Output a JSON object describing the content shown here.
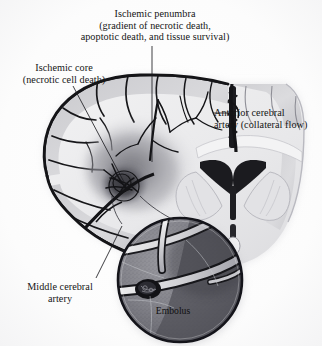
{
  "figure": {
    "kind": "medical-illustration",
    "background_color": "#fdfdfd",
    "ink_color": "#151515"
  },
  "labels": {
    "penumbra": {
      "name": "ischemic-penumbra-label",
      "line1": "Ischemic penumbra",
      "line2": "(gradient of necrotic death,",
      "line3": "apoptotic death, and tissue survival)",
      "text": "Ischemic penumbra\n(gradient of necrotic death,\napoptotic death, and tissue survival)"
    },
    "core": {
      "name": "ischemic-core-label",
      "line1": "Ischemic core",
      "line2": "(necrotic cell death)",
      "text": "Ischemic core\n(necrotic cell death)"
    },
    "anterior_cerebral_artery": {
      "name": "anterior-cerebral-artery-label",
      "line1": "Anterior cerebral",
      "line2": "artery (collateral flow)",
      "text": "Anterior cerebral\nartery (collateral flow)"
    },
    "middle_cerebral_artery": {
      "name": "middle-cerebral-artery-label",
      "line1": "Middle cerebral",
      "line2": "artery",
      "text": "Middle cerebral\nartery"
    },
    "embolus": {
      "name": "embolus-label",
      "text": "Embolus"
    }
  },
  "regions": [
    {
      "id": "ischemic-core",
      "label": "Ischemic core",
      "tone": "dark-gray",
      "color": "#5d5d62"
    },
    {
      "id": "ischemic-penumbra",
      "label": "Ischemic penumbra",
      "tone": "mid-gray gradient",
      "color": "#9a9aa0"
    },
    {
      "id": "cortex-gray-matter",
      "label": "Cerebral cortex",
      "tone": "light-gray",
      "color": "#cfcfd2"
    },
    {
      "id": "white-matter",
      "label": "White matter",
      "tone": "near-white",
      "color": "#ececee"
    },
    {
      "id": "lateral-ventricles",
      "label": "Lateral ventricles",
      "tone": "black",
      "color": "#1c1c1e"
    },
    {
      "id": "third-ventricle",
      "label": "Third ventricle",
      "tone": "black",
      "color": "#1c1c1e"
    },
    {
      "id": "magnifier-inset",
      "label": "Embolus magnification",
      "tone": "stippled gray",
      "color": "#7b7b80"
    }
  ],
  "leaders": [
    {
      "id": "leader-penumbra",
      "from_label": "penumbra",
      "to_region": "ischemic-penumbra"
    },
    {
      "id": "leader-core",
      "from_label": "core",
      "to_region": "ischemic-core"
    },
    {
      "id": "leader-aca",
      "from_label": "anterior_cerebral_artery",
      "to_region": "anterior-cerebral-artery-vessel"
    },
    {
      "id": "leader-mca",
      "from_label": "middle_cerebral_artery",
      "to_region": "middle-cerebral-artery-vessel"
    }
  ]
}
